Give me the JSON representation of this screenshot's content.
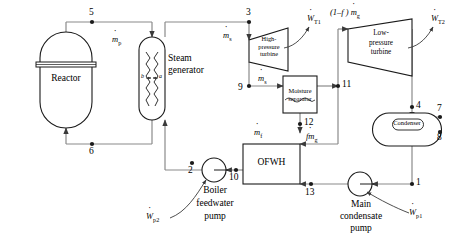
{
  "diagram": {
    "type": "process-flow-diagram",
    "line_color": "#808080",
    "stroke_color": "#1a1a1a",
    "text_color": "#000000"
  },
  "components": {
    "reactor": {
      "label": "Reactor",
      "shape": "capsule-vertical"
    },
    "steam_generator": {
      "label_line1": "Steam",
      "label_line2": "generator",
      "shape": "capsule-vertical-coils",
      "coil_left_label": "b",
      "coil_right_label": "a"
    },
    "hp_turbine": {
      "label_line1": "High-",
      "label_line2": "pressure",
      "label_line3": "turbine",
      "shape": "trapezoid-expanding"
    },
    "lp_turbine": {
      "label_line1": "Low-",
      "label_line2": "pressure",
      "label_line3": "turbine",
      "shape": "trapezoid-expanding"
    },
    "moisture_separator": {
      "label_line1": "Moisture",
      "label_line2": "separator",
      "shape": "rectangle-with-liquid"
    },
    "ofwh": {
      "label": "OFWH",
      "shape": "rectangle"
    },
    "condenser": {
      "label": "Condenser",
      "shape": "capsule-horizontal-nested"
    },
    "boiler_feedwater_pump": {
      "label_line1": "Boiler",
      "label_line2": "feedwater",
      "label_line3": "pump",
      "shape": "circle"
    },
    "main_condensate_pump": {
      "label_line1": "Main",
      "label_line2": "condensate",
      "label_line3": "pump",
      "shape": "circle"
    }
  },
  "state_points": [
    {
      "id": "1",
      "label": "1"
    },
    {
      "id": "2",
      "label": "2"
    },
    {
      "id": "3",
      "label": "3"
    },
    {
      "id": "4",
      "label": "4"
    },
    {
      "id": "5",
      "label": "5"
    },
    {
      "id": "6",
      "label": "6"
    },
    {
      "id": "7",
      "label": "7"
    },
    {
      "id": "8",
      "label": "8"
    },
    {
      "id": "9",
      "label": "9"
    },
    {
      "id": "10",
      "label": "10"
    },
    {
      "id": "11",
      "label": "11"
    },
    {
      "id": "12",
      "label": "12"
    },
    {
      "id": "13",
      "label": "13"
    }
  ],
  "flow_labels": {
    "m_p": {
      "symbol": "m",
      "sub": "p",
      "dot": true,
      "desc": "primary coolant mass flow rate"
    },
    "m_s_top": {
      "symbol": "m",
      "sub": "s",
      "dot": true,
      "desc": "steam mass flow rate at state 3"
    },
    "m_s_mid": {
      "symbol": "m",
      "sub": "s",
      "dot": true,
      "desc": "steam mass flow rate at state 9"
    },
    "m_f": {
      "symbol": "m",
      "sub": "f",
      "dot": true,
      "desc": "moisture/feed mass flow rate at state 12"
    },
    "fm_g": {
      "symbol": "fm",
      "sub": "g",
      "dot": true,
      "desc": "extracted fraction f of steam to OFWH"
    },
    "one_minus_f_m_g": {
      "prefix": "(1–f )",
      "symbol": "m",
      "sub": "g",
      "dot": true,
      "desc": "remaining steam to low-pressure turbine"
    }
  },
  "work_labels": {
    "W_T1": {
      "symbol": "W",
      "sub": "T1",
      "dot": true,
      "desc": "high-pressure turbine work output"
    },
    "W_T2": {
      "symbol": "W",
      "sub": "T2",
      "dot": true,
      "desc": "low-pressure turbine work output"
    },
    "W_p1": {
      "symbol": "W",
      "sub": "p1",
      "dot": true,
      "desc": "main condensate pump work input"
    },
    "W_p2": {
      "symbol": "W",
      "sub": "p2",
      "dot": true,
      "desc": "boiler feedwater pump work input"
    }
  }
}
